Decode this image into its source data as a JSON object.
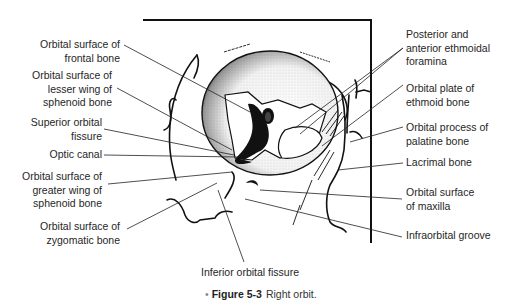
{
  "figure": {
    "number": "Figure 5-3",
    "caption": "Right orbit.",
    "bullet": "•"
  },
  "labels_left": [
    {
      "id": "frontal",
      "lines": [
        "Orbital surface of",
        "frontal bone"
      ]
    },
    {
      "id": "lesser-wing",
      "lines": [
        "Orbital surface of",
        "lesser wing of",
        "sphenoid bone"
      ]
    },
    {
      "id": "superior-fissure",
      "lines": [
        "Superior orbital",
        "fissure"
      ]
    },
    {
      "id": "optic-canal",
      "lines": [
        "Optic canal"
      ]
    },
    {
      "id": "greater-wing",
      "lines": [
        "Orbital surface of",
        "greater wing of",
        "sphenoid bone"
      ]
    },
    {
      "id": "zygomatic",
      "lines": [
        "Orbital surface of",
        "zygomatic bone"
      ]
    }
  ],
  "labels_right": [
    {
      "id": "ethmoidal-foramina",
      "lines": [
        "Posterior and",
        "anterior ethmoidal",
        "foramina"
      ]
    },
    {
      "id": "ethmoid-plate",
      "lines": [
        "Orbital plate of",
        "ethmoid bone"
      ]
    },
    {
      "id": "palatine",
      "lines": [
        "Orbital process of",
        "palatine bone"
      ]
    },
    {
      "id": "lacrimal",
      "lines": [
        "Lacrimal bone"
      ]
    },
    {
      "id": "maxilla",
      "lines": [
        "Orbital surface",
        "of maxilla"
      ]
    },
    {
      "id": "infraorbital-groove",
      "lines": [
        "Infraorbital groove"
      ]
    }
  ],
  "labels_bottom": [
    {
      "id": "inferior-fissure",
      "lines": [
        "Inferior orbital fissure"
      ]
    }
  ],
  "colors": {
    "ink": "#111111",
    "text": "#262626",
    "bullet": "#888888"
  }
}
